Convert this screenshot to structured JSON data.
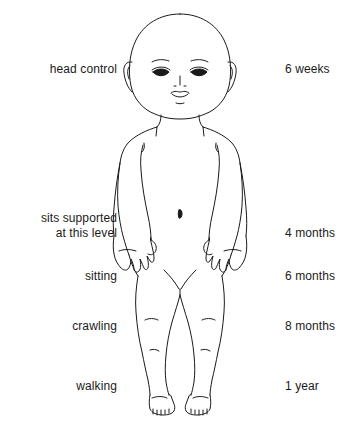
{
  "figure": {
    "caption_left_column_title": "",
    "caption_right_column_title": "",
    "line_color": "#1a1a1a",
    "background_color": "#ffffff",
    "milestones": [
      {
        "skill": "head control",
        "age": "6 weeks",
        "y": 62
      },
      {
        "skill": "sits supported\nat this level",
        "age": "4 months",
        "y": 211
      },
      {
        "skill": "sitting",
        "age": "6 months",
        "y": 269
      },
      {
        "skill": "crawling",
        "age": "8 months",
        "y": 319
      },
      {
        "skill": "walking",
        "age": "1 year",
        "y": 379
      }
    ]
  },
  "labels_left": [
    "head control",
    "sits supported\nat this level",
    "sitting",
    "crawling",
    "walking"
  ],
  "labels_right": [
    "6 weeks",
    "4 months",
    "6 months",
    "8 months",
    "1 year"
  ]
}
